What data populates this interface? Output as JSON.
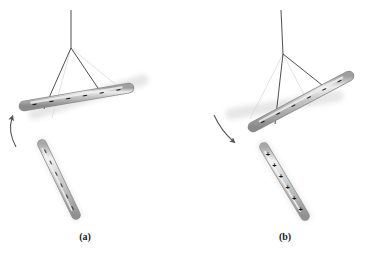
{
  "figure": {
    "background_color": "#ffffff",
    "caption_font_color": "#1a1a1a",
    "panels": [
      {
        "id": "a",
        "label": "(a)",
        "label_x": 85,
        "label_y": 240,
        "description": "Negatively charged rod brought near a suspended negatively charged rod; the suspended rod swings away (repulsion).",
        "interaction": "repulsion",
        "suspended_rod": {
          "name": "suspended-rod",
          "charge_symbol": "−",
          "charge_sign": "negative",
          "charge_count": 6,
          "x1": 24,
          "y1": 106,
          "x2": 129,
          "y2": 88,
          "thickness": 9,
          "angle_deg": -9.7,
          "body_color": "#b9b9b9",
          "edge_color": "#8d8d8d",
          "highlight_color": "#e8e8e8"
        },
        "ghost_rod": {
          "name": "motion-blur-ghost-rod",
          "x1": 34,
          "y1": 114,
          "x2": 143,
          "y2": 80,
          "thickness": 11,
          "color": "#e2e2e2",
          "opacity": 0.85
        },
        "handheld_rod": {
          "name": "handheld-charged-rod",
          "charge_symbol": "−",
          "charge_sign": "negative",
          "charge_count": 6,
          "x1": 42,
          "y1": 144,
          "x2": 76,
          "y2": 215,
          "thickness": 8,
          "angle_deg": 64.4,
          "body_color": "#bdbdbd",
          "edge_color": "#909090",
          "highlight_color": "#ececec"
        },
        "suspension": {
          "name": "suspension-strings",
          "anchor_x": 71,
          "anchor_y": 48,
          "top_x": 71,
          "top_y": 10,
          "string_color": "#3a3a3a",
          "ghost_string_color": "#d6d6d6",
          "strings": [
            {
              "x": 44,
              "y": 109
            },
            {
              "x": 104,
              "y": 97
            }
          ],
          "ghost_strings": [
            {
              "x": 52,
              "y": 118
            },
            {
              "x": 120,
              "y": 88
            }
          ]
        },
        "motion_arrow": {
          "name": "motion-arrow-up",
          "direction": "up",
          "path": "M 16 147 C 10 136, 9 127, 12 118",
          "head_x": 12.4,
          "head_y": 116,
          "head_angle_deg": -16,
          "color": "#555555"
        }
      },
      {
        "id": "b",
        "label": "(b)",
        "label_x": 285,
        "label_y": 240,
        "description": "Positively charged rod brought near a suspended negatively charged rod; the suspended rod swings toward it (attraction).",
        "interaction": "attraction",
        "suspended_rod": {
          "name": "suspended-rod",
          "charge_symbol": "−",
          "charge_sign": "negative",
          "charge_count": 6,
          "x1": 253,
          "y1": 127,
          "x2": 349,
          "y2": 76,
          "thickness": 9,
          "angle_deg": -28,
          "body_color": "#b9b9b9",
          "edge_color": "#8d8d8d",
          "highlight_color": "#e8e8e8"
        },
        "ghost_rod": {
          "name": "motion-blur-ghost-rod",
          "x1": 231,
          "y1": 114,
          "x2": 338,
          "y2": 96,
          "thickness": 11,
          "color": "#e2e2e2",
          "opacity": 0.85
        },
        "handheld_rod": {
          "name": "handheld-charged-rod",
          "charge_symbol": "+",
          "charge_sign": "positive",
          "charge_count": 6,
          "x1": 264,
          "y1": 147,
          "x2": 305,
          "y2": 216,
          "thickness": 8,
          "angle_deg": 59.3,
          "body_color": "#c2c2c2",
          "edge_color": "#9a9a9a",
          "highlight_color": "#efefef"
        },
        "suspension": {
          "name": "suspension-strings",
          "anchor_x": 283,
          "anchor_y": 54,
          "top_x": 281,
          "top_y": 10,
          "string_color": "#3a3a3a",
          "ghost_string_color": "#d6d6d6",
          "strings": [
            {
              "x": 275,
              "y": 124
            },
            {
              "x": 327,
              "y": 89
            }
          ],
          "ghost_strings": [
            {
              "x": 250,
              "y": 119
            },
            {
              "x": 310,
              "y": 106
            }
          ]
        },
        "motion_arrow": {
          "name": "motion-arrow-down",
          "direction": "down-right",
          "path": "M 214 115 C 219 126, 225 134, 233 141",
          "head_x": 234.5,
          "head_y": 142.5,
          "head_angle_deg": 46,
          "color": "#555555"
        }
      }
    ]
  }
}
